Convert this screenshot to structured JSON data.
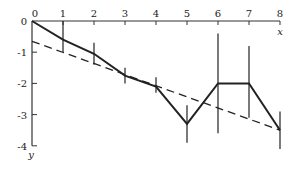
{
  "chart_data": {
    "type": "line",
    "title": "",
    "xlabel": "x",
    "ylabel": "y",
    "xlim": [
      0,
      8
    ],
    "ylim": [
      -4,
      0
    ],
    "x_ticks": [
      "0",
      "1",
      "2",
      "3",
      "4",
      "5",
      "6",
      "7",
      "8"
    ],
    "y_ticks": [
      "0",
      "-1",
      "-2",
      "-3",
      "-4"
    ],
    "grid": false,
    "legend": null,
    "series": [
      {
        "name": "data",
        "style": "solid",
        "x": [
          0,
          1,
          2,
          3,
          4,
          5,
          6,
          7,
          8
        ],
        "values": [
          0,
          -0.6,
          -1.05,
          -1.75,
          -2.1,
          -3.3,
          -2.0,
          -2.0,
          -3.5
        ],
        "error_low": [
          0,
          -1.0,
          -1.4,
          -2.0,
          -2.3,
          -3.9,
          -3.6,
          -3.1,
          -4.1
        ],
        "error_high": [
          0,
          0,
          -0.7,
          -1.5,
          -1.8,
          -2.7,
          -0.4,
          -0.8,
          -2.9
        ]
      },
      {
        "name": "fit",
        "style": "dashed",
        "x": [
          0,
          8
        ],
        "values": [
          -0.65,
          -3.5
        ]
      }
    ]
  },
  "colors": {
    "line": "#222222",
    "axis": "#333333"
  }
}
